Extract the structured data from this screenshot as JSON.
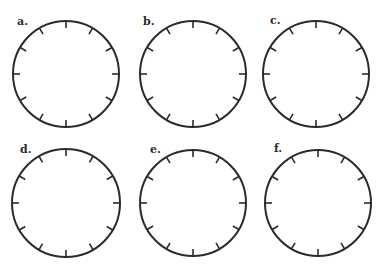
{
  "worksheet": {
    "stroke_color": "#2b2b2b",
    "clocks": [
      {
        "label": "a.",
        "cx": 66,
        "cy": 74,
        "r": 53,
        "label_x": 17,
        "label_y": 16
      },
      {
        "label": "b.",
        "cx": 193,
        "cy": 74,
        "r": 53,
        "label_x": 143,
        "label_y": 16
      },
      {
        "label": "c.",
        "cx": 316,
        "cy": 74,
        "r": 53,
        "label_x": 270,
        "label_y": 15
      },
      {
        "label": "d.",
        "cx": 66,
        "cy": 203,
        "r": 54,
        "label_x": 20,
        "label_y": 144
      },
      {
        "label": "e.",
        "cx": 193,
        "cy": 203,
        "r": 53,
        "label_x": 150,
        "label_y": 144
      },
      {
        "label": "f.",
        "cx": 318,
        "cy": 203,
        "r": 53,
        "label_x": 274,
        "label_y": 143
      }
    ],
    "ticks_per_face": 12
  }
}
